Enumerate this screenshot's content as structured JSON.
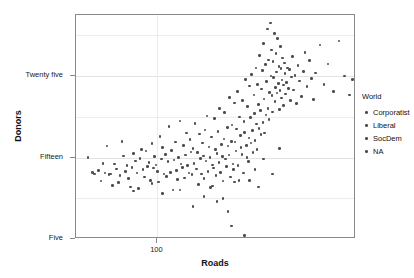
{
  "chart_data": {
    "type": "scatter",
    "title": "",
    "xlabel": "Roads",
    "ylabel": "Donors",
    "xscale": "log",
    "xlim": [
      55,
      430
    ],
    "ylim": [
      5,
      32.5
    ],
    "grid": true,
    "xticks": [
      {
        "value": 100,
        "label": "100"
      }
    ],
    "yticks": [
      {
        "value": 5,
        "label": "Five"
      },
      {
        "value": 15,
        "label": "Fifteen"
      },
      {
        "value": 25,
        "label": "Twenty five"
      }
    ],
    "y_minor_gridlines": [
      10,
      20,
      30
    ],
    "legend": {
      "title": "World",
      "position": "right",
      "entries": [
        {
          "label": "Corporatist",
          "color": "#4d4d4d"
        },
        {
          "label": "Liberal",
          "color": "#4d4d4d"
        },
        {
          "label": "SocDem",
          "color": "#4d4d4d"
        },
        {
          "label": "NA",
          "color": "#4d4d4d"
        }
      ]
    },
    "point_color": "#4d4d4d",
    "points": [
      [
        60,
        15.0
      ],
      [
        62,
        13.2
      ],
      [
        63,
        13.0
      ],
      [
        65,
        13.4
      ],
      [
        66,
        12.1
      ],
      [
        67,
        14.3
      ],
      [
        68,
        13.1
      ],
      [
        69,
        16.4
      ],
      [
        70,
        12.9
      ],
      [
        71,
        13.0
      ],
      [
        72,
        11.6
      ],
      [
        73,
        14.2
      ],
      [
        74,
        13.6
      ],
      [
        75,
        11.9
      ],
      [
        76,
        12.8
      ],
      [
        77,
        17.0
      ],
      [
        78,
        15.2
      ],
      [
        79,
        13.3
      ],
      [
        80,
        14.0
      ],
      [
        81,
        12.4
      ],
      [
        82,
        11.4
      ],
      [
        83,
        13.8
      ],
      [
        84,
        15.5
      ],
      [
        85,
        14.6
      ],
      [
        86,
        13.1
      ],
      [
        87,
        11.2
      ],
      [
        88,
        14.9
      ],
      [
        89,
        16.0
      ],
      [
        90,
        13.5
      ],
      [
        91,
        12.6
      ],
      [
        92,
        15.8
      ],
      [
        93,
        13.9
      ],
      [
        94,
        14.4
      ],
      [
        95,
        12.2
      ],
      [
        96,
        16.7
      ],
      [
        97,
        13.7
      ],
      [
        98,
        15.1
      ],
      [
        99,
        14.1
      ],
      [
        100,
        13.3
      ],
      [
        101,
        12.0
      ],
      [
        102,
        17.6
      ],
      [
        103,
        14.8
      ],
      [
        104,
        16.2
      ],
      [
        105,
        13.0
      ],
      [
        106,
        15.4
      ],
      [
        107,
        12.7
      ],
      [
        108,
        14.5
      ],
      [
        109,
        18.8
      ],
      [
        110,
        13.2
      ],
      [
        111,
        15.9
      ],
      [
        112,
        11.0
      ],
      [
        113,
        14.7
      ],
      [
        114,
        16.9
      ],
      [
        115,
        13.4
      ],
      [
        116,
        12.3
      ],
      [
        117,
        15.0
      ],
      [
        118,
        19.5
      ],
      [
        119,
        14.2
      ],
      [
        120,
        13.8
      ],
      [
        121,
        16.5
      ],
      [
        122,
        12.5
      ],
      [
        123,
        15.3
      ],
      [
        124,
        18.0
      ],
      [
        125,
        14.0
      ],
      [
        126,
        13.1
      ],
      [
        127,
        17.2
      ],
      [
        128,
        15.7
      ],
      [
        129,
        12.9
      ],
      [
        130,
        16.1
      ],
      [
        131,
        14.3
      ],
      [
        132,
        19.2
      ],
      [
        133,
        13.6
      ],
      [
        134,
        15.6
      ],
      [
        135,
        11.7
      ],
      [
        136,
        17.9
      ],
      [
        137,
        14.9
      ],
      [
        138,
        13.0
      ],
      [
        139,
        16.8
      ],
      [
        140,
        15.2
      ],
      [
        141,
        12.4
      ],
      [
        142,
        18.4
      ],
      [
        143,
        14.6
      ],
      [
        144,
        20.1
      ],
      [
        145,
        13.3
      ],
      [
        146,
        16.3
      ],
      [
        147,
        15.0
      ],
      [
        148,
        11.3
      ],
      [
        149,
        17.5
      ],
      [
        150,
        14.1
      ],
      [
        151,
        13.7
      ],
      [
        152,
        19.8
      ],
      [
        153,
        16.0
      ],
      [
        154,
        12.8
      ],
      [
        155,
        15.5
      ],
      [
        156,
        18.2
      ],
      [
        157,
        14.4
      ],
      [
        158,
        21.0
      ],
      [
        159,
        13.2
      ],
      [
        160,
        16.6
      ],
      [
        161,
        15.1
      ],
      [
        162,
        12.1
      ],
      [
        163,
        17.3
      ],
      [
        164,
        20.5
      ],
      [
        165,
        14.8
      ],
      [
        166,
        13.9
      ],
      [
        167,
        18.7
      ],
      [
        168,
        16.4
      ],
      [
        169,
        15.3
      ],
      [
        170,
        22.4
      ],
      [
        171,
        12.6
      ],
      [
        172,
        17.0
      ],
      [
        173,
        19.0
      ],
      [
        174,
        14.2
      ],
      [
        175,
        13.5
      ],
      [
        176,
        21.7
      ],
      [
        177,
        16.9
      ],
      [
        178,
        15.8
      ],
      [
        179,
        18.5
      ],
      [
        180,
        23.1
      ],
      [
        181,
        14.0
      ],
      [
        182,
        12.2
      ],
      [
        183,
        20.0
      ],
      [
        184,
        17.7
      ],
      [
        185,
        16.2
      ],
      [
        186,
        15.4
      ],
      [
        187,
        22.0
      ],
      [
        188,
        13.1
      ],
      [
        189,
        19.4
      ],
      [
        190,
        18.1
      ],
      [
        191,
        24.6
      ],
      [
        192,
        16.5
      ],
      [
        193,
        15.0
      ],
      [
        194,
        21.3
      ],
      [
        195,
        14.5
      ],
      [
        196,
        17.4
      ],
      [
        197,
        23.8
      ],
      [
        198,
        19.9
      ],
      [
        199,
        16.8
      ],
      [
        200,
        25.2
      ],
      [
        201,
        18.3
      ],
      [
        202,
        15.6
      ],
      [
        203,
        22.7
      ],
      [
        204,
        20.4
      ],
      [
        205,
        17.1
      ],
      [
        206,
        26.0
      ],
      [
        207,
        19.1
      ],
      [
        208,
        16.0
      ],
      [
        209,
        24.0
      ],
      [
        210,
        21.5
      ],
      [
        211,
        18.6
      ],
      [
        212,
        27.5
      ],
      [
        213,
        20.8
      ],
      [
        214,
        17.8
      ],
      [
        215,
        23.4
      ],
      [
        216,
        25.7
      ],
      [
        217,
        19.3
      ],
      [
        218,
        29.0
      ],
      [
        219,
        22.2
      ],
      [
        220,
        18.0
      ],
      [
        221,
        26.4
      ],
      [
        222,
        20.2
      ],
      [
        223,
        24.3
      ],
      [
        224,
        30.8
      ],
      [
        225,
        21.0
      ],
      [
        226,
        27.0
      ],
      [
        227,
        19.7
      ],
      [
        228,
        23.0
      ],
      [
        229,
        31.5
      ],
      [
        230,
        25.0
      ],
      [
        231,
        28.2
      ],
      [
        232,
        22.6
      ],
      [
        233,
        20.6
      ],
      [
        234,
        26.8
      ],
      [
        235,
        24.8
      ],
      [
        236,
        30.2
      ],
      [
        237,
        21.9
      ],
      [
        238,
        23.6
      ],
      [
        239,
        27.8
      ],
      [
        240,
        25.5
      ],
      [
        241,
        22.9
      ],
      [
        242,
        29.6
      ],
      [
        243,
        24.1
      ],
      [
        244,
        26.2
      ],
      [
        245,
        20.9
      ],
      [
        246,
        23.2
      ],
      [
        247,
        28.6
      ],
      [
        248,
        25.9
      ],
      [
        249,
        22.3
      ],
      [
        250,
        24.5
      ],
      [
        251,
        27.2
      ],
      [
        252,
        21.4
      ],
      [
        253,
        23.9
      ],
      [
        254,
        26.6
      ],
      [
        255,
        25.3
      ],
      [
        256,
        22.8
      ],
      [
        258,
        24.2
      ],
      [
        260,
        26.0
      ],
      [
        262,
        23.5
      ],
      [
        264,
        25.8
      ],
      [
        266,
        22.0
      ],
      [
        268,
        24.9
      ],
      [
        270,
        27.4
      ],
      [
        272,
        23.3
      ],
      [
        275,
        25.1
      ],
      [
        278,
        21.6
      ],
      [
        281,
        26.3
      ],
      [
        284,
        24.4
      ],
      [
        288,
        22.5
      ],
      [
        292,
        25.6
      ],
      [
        296,
        27.9
      ],
      [
        300,
        23.7
      ],
      [
        305,
        26.9
      ],
      [
        310,
        24.7
      ],
      [
        315,
        22.1
      ],
      [
        320,
        25.4
      ],
      [
        330,
        28.8
      ],
      [
        340,
        24.0
      ],
      [
        350,
        26.5
      ],
      [
        365,
        23.1
      ],
      [
        380,
        29.3
      ],
      [
        395,
        25.0
      ],
      [
        410,
        22.7
      ],
      [
        420,
        24.6
      ],
      [
        155,
        9.6
      ],
      [
        168,
        8.4
      ],
      [
        172,
        6.6
      ],
      [
        188,
        5.1
      ],
      [
        190,
        5.4
      ],
      [
        130,
        9.0
      ],
      [
        141,
        10.2
      ],
      [
        118,
        11.0
      ],
      [
        104,
        10.6
      ],
      [
        96,
        11.8
      ],
      [
        84,
        10.9
      ],
      [
        150,
        11.5
      ],
      [
        162,
        10.0
      ],
      [
        176,
        12.0
      ],
      [
        205,
        13.5
      ],
      [
        218,
        14.8
      ],
      [
        233,
        13.0
      ],
      [
        245,
        16.1
      ],
      [
        197,
        12.2
      ],
      [
        210,
        11.4
      ]
    ]
  }
}
